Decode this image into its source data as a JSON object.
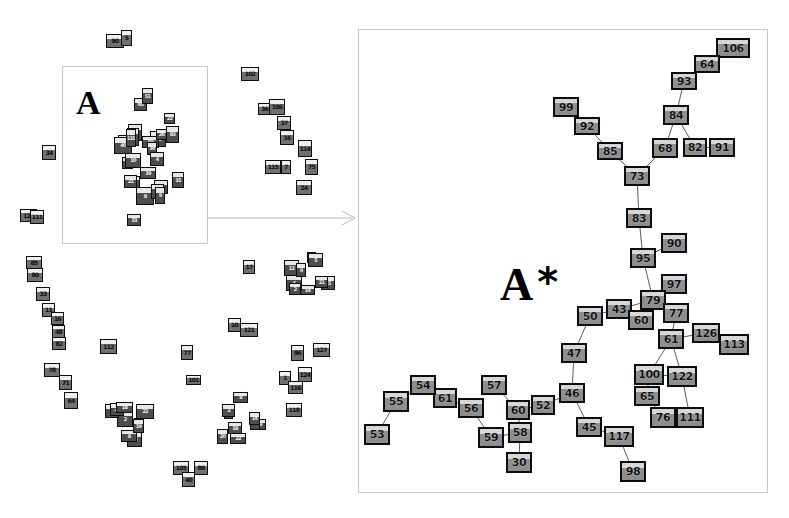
{
  "figure": {
    "type": "node-link-graph",
    "background_color": "#ffffff",
    "node_fill_color": "#9b9b9b",
    "node_border_color": "#0d0d0d",
    "edge_color": "#4a4a4a",
    "panel_border_color": "#c9c9c9"
  },
  "overview_panel": {
    "name": "overview",
    "region_box": {
      "x": 62,
      "y": 66,
      "w": 146,
      "h": 178
    },
    "region_label": "A",
    "asterisk": ""
  },
  "detail_panel": {
    "name": "detail",
    "box": {
      "x": 358,
      "y": 29,
      "w": 410,
      "h": 464
    },
    "region_label": "A",
    "asterisk": "*"
  },
  "chart_data": {
    "type": "scatter",
    "title": "",
    "xlabel": "",
    "ylabel": "",
    "legend": [],
    "detail_nodes": [
      {
        "id": "106",
        "x": 716,
        "y": 38,
        "w": 34,
        "h": 20
      },
      {
        "id": "64",
        "x": 694,
        "y": 55,
        "w": 26,
        "h": 18
      },
      {
        "id": "93",
        "x": 671,
        "y": 72,
        "w": 26,
        "h": 18
      },
      {
        "id": "84",
        "x": 663,
        "y": 105,
        "w": 26,
        "h": 20
      },
      {
        "id": "99",
        "x": 553,
        "y": 97,
        "w": 26,
        "h": 20
      },
      {
        "id": "92",
        "x": 574,
        "y": 117,
        "w": 26,
        "h": 18
      },
      {
        "id": "85",
        "x": 597,
        "y": 142,
        "w": 26,
        "h": 18
      },
      {
        "id": "68",
        "x": 652,
        "y": 138,
        "w": 26,
        "h": 20
      },
      {
        "id": "82",
        "x": 683,
        "y": 138,
        "w": 24,
        "h": 19
      },
      {
        "id": "91",
        "x": 709,
        "y": 138,
        "w": 26,
        "h": 19
      },
      {
        "id": "73",
        "x": 624,
        "y": 166,
        "w": 26,
        "h": 20
      },
      {
        "id": "83",
        "x": 626,
        "y": 208,
        "w": 26,
        "h": 20
      },
      {
        "id": "90",
        "x": 661,
        "y": 233,
        "w": 26,
        "h": 20
      },
      {
        "id": "95",
        "x": 630,
        "y": 248,
        "w": 26,
        "h": 20
      },
      {
        "id": "97",
        "x": 661,
        "y": 274,
        "w": 26,
        "h": 20
      },
      {
        "id": "79",
        "x": 640,
        "y": 290,
        "w": 26,
        "h": 20
      },
      {
        "id": "43",
        "x": 606,
        "y": 299,
        "w": 26,
        "h": 20
      },
      {
        "id": "60",
        "x": 628,
        "y": 310,
        "w": 26,
        "h": 20
      },
      {
        "id": "77",
        "x": 663,
        "y": 303,
        "w": 26,
        "h": 20
      },
      {
        "id": "50",
        "x": 577,
        "y": 306,
        "w": 26,
        "h": 20
      },
      {
        "id": "61",
        "x": 658,
        "y": 329,
        "w": 26,
        "h": 20
      },
      {
        "id": "126",
        "x": 692,
        "y": 323,
        "w": 28,
        "h": 20
      },
      {
        "id": "113",
        "x": 719,
        "y": 334,
        "w": 30,
        "h": 21
      },
      {
        "id": "47",
        "x": 561,
        "y": 343,
        "w": 26,
        "h": 20
      },
      {
        "id": "100",
        "x": 634,
        "y": 364,
        "w": 30,
        "h": 21
      },
      {
        "id": "122",
        "x": 667,
        "y": 366,
        "w": 30,
        "h": 21
      },
      {
        "id": "65",
        "x": 634,
        "y": 386,
        "w": 26,
        "h": 20
      },
      {
        "id": "76",
        "x": 650,
        "y": 407,
        "w": 26,
        "h": 21
      },
      {
        "id": "111",
        "x": 676,
        "y": 407,
        "w": 28,
        "h": 21
      },
      {
        "id": "46",
        "x": 559,
        "y": 383,
        "w": 26,
        "h": 20
      },
      {
        "id": "45",
        "x": 576,
        "y": 417,
        "w": 26,
        "h": 20
      },
      {
        "id": "117",
        "x": 604,
        "y": 426,
        "w": 30,
        "h": 21
      },
      {
        "id": "98",
        "x": 620,
        "y": 461,
        "w": 26,
        "h": 21
      },
      {
        "id": "52",
        "x": 531,
        "y": 395,
        "w": 24,
        "h": 20
      },
      {
        "id": "60b",
        "x": 506,
        "y": 400,
        "w": 24,
        "h": 20,
        "label": "60"
      },
      {
        "id": "57",
        "x": 481,
        "y": 375,
        "w": 26,
        "h": 20
      },
      {
        "id": "58",
        "x": 508,
        "y": 422,
        "w": 24,
        "h": 21
      },
      {
        "id": "59",
        "x": 478,
        "y": 427,
        "w": 26,
        "h": 21
      },
      {
        "id": "30",
        "x": 506,
        "y": 452,
        "w": 26,
        "h": 21
      },
      {
        "id": "56",
        "x": 458,
        "y": 398,
        "w": 26,
        "h": 20
      },
      {
        "id": "61b",
        "x": 433,
        "y": 388,
        "w": 24,
        "h": 20,
        "label": "61"
      },
      {
        "id": "54",
        "x": 410,
        "y": 375,
        "w": 26,
        "h": 20
      },
      {
        "id": "55",
        "x": 383,
        "y": 391,
        "w": 26,
        "h": 21
      },
      {
        "id": "53",
        "x": 364,
        "y": 424,
        "w": 26,
        "h": 21
      }
    ],
    "detail_edges": [
      [
        "106",
        "64"
      ],
      [
        "64",
        "93"
      ],
      [
        "93",
        "84"
      ],
      [
        "84",
        "68"
      ],
      [
        "84",
        "82"
      ],
      [
        "82",
        "91"
      ],
      [
        "99",
        "92"
      ],
      [
        "92",
        "85"
      ],
      [
        "85",
        "73"
      ],
      [
        "73",
        "68"
      ],
      [
        "73",
        "83"
      ],
      [
        "83",
        "95"
      ],
      [
        "95",
        "90"
      ],
      [
        "95",
        "79"
      ],
      [
        "79",
        "97"
      ],
      [
        "79",
        "43"
      ],
      [
        "79",
        "60"
      ],
      [
        "79",
        "77"
      ],
      [
        "43",
        "50"
      ],
      [
        "43",
        "60"
      ],
      [
        "77",
        "61"
      ],
      [
        "61",
        "126"
      ],
      [
        "126",
        "113"
      ],
      [
        "61",
        "100"
      ],
      [
        "61",
        "122"
      ],
      [
        "100",
        "122"
      ],
      [
        "100",
        "65"
      ],
      [
        "65",
        "76"
      ],
      [
        "76",
        "111"
      ],
      [
        "122",
        "111"
      ],
      [
        "50",
        "47"
      ],
      [
        "47",
        "46"
      ],
      [
        "46",
        "52"
      ],
      [
        "46",
        "45"
      ],
      [
        "45",
        "117"
      ],
      [
        "117",
        "98"
      ],
      [
        "52",
        "60b"
      ],
      [
        "60b",
        "58"
      ],
      [
        "60b",
        "57"
      ],
      [
        "58",
        "59"
      ],
      [
        "58",
        "30"
      ],
      [
        "59",
        "56"
      ],
      [
        "56",
        "61b"
      ],
      [
        "61b",
        "54"
      ],
      [
        "54",
        "55"
      ],
      [
        "55",
        "53"
      ]
    ],
    "overview_clusters": [
      {
        "name": "top-isolated",
        "nodes": [
          "90",
          "5"
        ]
      },
      {
        "name": "region-A",
        "nodes": [
          "64",
          "15",
          "39",
          "8",
          "7",
          "32",
          "21",
          "33",
          "20",
          "10",
          "77",
          "12",
          "40",
          "65",
          "1",
          "115",
          "51",
          "52",
          "22",
          "50",
          "34",
          "26",
          "4",
          "83",
          "9"
        ]
      },
      {
        "name": "right-chain",
        "nodes": [
          "102",
          "36",
          "106",
          "37",
          "16",
          "114",
          "115",
          "7",
          "75",
          "24"
        ]
      },
      {
        "name": "left-chain",
        "nodes": [
          "85",
          "80",
          "33",
          "11",
          "16",
          "48",
          "82",
          "78",
          "71",
          "64"
        ]
      },
      {
        "name": "mid-cluster",
        "nodes": [
          "15",
          "14",
          "6",
          "2",
          "12"
        ]
      },
      {
        "name": "lower-cluster",
        "nodes": [
          "14",
          "13",
          "8",
          "2",
          "72",
          "20",
          "18",
          "22",
          "19"
        ]
      },
      {
        "name": "right-lower",
        "nodes": [
          "96",
          "127",
          "1",
          "124",
          "116",
          "118",
          "11",
          "104"
        ]
      },
      {
        "name": "bottom-pair",
        "nodes": [
          "105",
          "89",
          "40"
        ]
      },
      {
        "name": "singletons",
        "nodes": [
          "121",
          "112",
          "77",
          "101",
          "10",
          "111",
          "17"
        ]
      }
    ],
    "overview_nodes": [
      {
        "id": "90",
        "x": 106,
        "y": 34,
        "w": 18,
        "h": 14
      },
      {
        "id": "5",
        "x": 121,
        "y": 30,
        "w": 11,
        "h": 16
      },
      {
        "id": "34",
        "x": 42,
        "y": 145,
        "w": 14,
        "h": 15
      },
      {
        "id": "121",
        "x": 20,
        "y": 209,
        "w": 17,
        "h": 13
      },
      {
        "id": "102",
        "x": 241,
        "y": 67,
        "w": 18,
        "h": 14
      },
      {
        "id": "36",
        "x": 258,
        "y": 103,
        "w": 13,
        "h": 12
      },
      {
        "id": "106",
        "x": 269,
        "y": 99,
        "w": 16,
        "h": 16
      },
      {
        "id": "37",
        "x": 277,
        "y": 116,
        "w": 14,
        "h": 14
      },
      {
        "id": "16",
        "x": 280,
        "y": 130,
        "w": 14,
        "h": 15
      },
      {
        "id": "114",
        "x": 298,
        "y": 140,
        "w": 14,
        "h": 17
      },
      {
        "id": "115",
        "x": 265,
        "y": 160,
        "w": 16,
        "h": 14
      },
      {
        "id": "7",
        "x": 281,
        "y": 160,
        "w": 10,
        "h": 14
      },
      {
        "id": "75",
        "x": 305,
        "y": 159,
        "w": 13,
        "h": 16
      },
      {
        "id": "24",
        "x": 296,
        "y": 180,
        "w": 16,
        "h": 15
      },
      {
        "id": "85",
        "x": 26,
        "y": 256,
        "w": 16,
        "h": 13
      },
      {
        "id": "80",
        "x": 27,
        "y": 268,
        "w": 16,
        "h": 14
      },
      {
        "id": "33",
        "x": 36,
        "y": 287,
        "w": 14,
        "h": 14
      },
      {
        "id": "11",
        "x": 42,
        "y": 303,
        "w": 13,
        "h": 14
      },
      {
        "id": "16b",
        "x": 51,
        "y": 312,
        "w": 13,
        "h": 13,
        "label": "16"
      },
      {
        "id": "48",
        "x": 52,
        "y": 325,
        "w": 13,
        "h": 13
      },
      {
        "id": "82",
        "x": 52,
        "y": 337,
        "w": 14,
        "h": 13
      },
      {
        "id": "78",
        "x": 44,
        "y": 363,
        "w": 16,
        "h": 14
      },
      {
        "id": "71",
        "x": 59,
        "y": 375,
        "w": 13,
        "h": 15
      },
      {
        "id": "64",
        "x": 64,
        "y": 392,
        "w": 14,
        "h": 17
      },
      {
        "id": "112",
        "x": 100,
        "y": 339,
        "w": 17,
        "h": 15
      },
      {
        "id": "10",
        "x": 228,
        "y": 318,
        "w": 13,
        "h": 14
      },
      {
        "id": "121b",
        "x": 240,
        "y": 323,
        "w": 18,
        "h": 14,
        "label": "121"
      },
      {
        "id": "77",
        "x": 181,
        "y": 345,
        "w": 12,
        "h": 15
      },
      {
        "id": "101",
        "x": 186,
        "y": 375,
        "w": 15,
        "h": 10
      },
      {
        "id": "96",
        "x": 291,
        "y": 345,
        "w": 13,
        "h": 16
      },
      {
        "id": "127",
        "x": 313,
        "y": 343,
        "w": 17,
        "h": 14
      },
      {
        "id": "1",
        "x": 279,
        "y": 371,
        "w": 12,
        "h": 14
      },
      {
        "id": "124",
        "x": 298,
        "y": 367,
        "w": 14,
        "h": 15
      },
      {
        "id": "116",
        "x": 288,
        "y": 381,
        "w": 15,
        "h": 13
      },
      {
        "id": "118",
        "x": 286,
        "y": 403,
        "w": 16,
        "h": 14
      },
      {
        "id": "17",
        "x": 243,
        "y": 260,
        "w": 12,
        "h": 14
      },
      {
        "id": "105",
        "x": 173,
        "y": 461,
        "w": 16,
        "h": 14
      },
      {
        "id": "89",
        "x": 194,
        "y": 461,
        "w": 14,
        "h": 14
      },
      {
        "id": "40",
        "x": 182,
        "y": 472,
        "w": 13,
        "h": 15
      },
      {
        "id": "111",
        "x": 30,
        "y": 210,
        "w": 14,
        "h": 14
      }
    ]
  },
  "text_labels": {
    "overview_region": "A",
    "detail_region": "A",
    "detail_asterisk": "*"
  }
}
